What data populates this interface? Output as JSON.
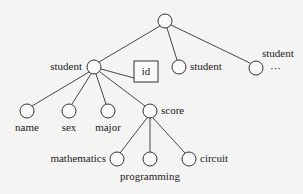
{
  "diagram": {
    "type": "tree",
    "nodes": {
      "root": {
        "label": ""
      },
      "student1": {
        "label": "student"
      },
      "id": {
        "label": "id"
      },
      "student2": {
        "label": "student"
      },
      "student3": {
        "label": "student"
      },
      "ellipsis": {
        "label": "···"
      },
      "name": {
        "label": "name"
      },
      "sex": {
        "label": "sex"
      },
      "major": {
        "label": "major"
      },
      "score": {
        "label": "score"
      },
      "mathematics": {
        "label": "mathematics"
      },
      "programming": {
        "label": "programming"
      },
      "circuit": {
        "label": "circuit"
      }
    },
    "edges": [
      [
        "root",
        "student1"
      ],
      [
        "root",
        "student2"
      ],
      [
        "root",
        "student3"
      ],
      [
        "student1",
        "id"
      ],
      [
        "student1",
        "name"
      ],
      [
        "student1",
        "sex"
      ],
      [
        "student1",
        "major"
      ],
      [
        "student1",
        "score"
      ],
      [
        "score",
        "mathematics"
      ],
      [
        "score",
        "programming"
      ],
      [
        "score",
        "circuit"
      ]
    ]
  }
}
